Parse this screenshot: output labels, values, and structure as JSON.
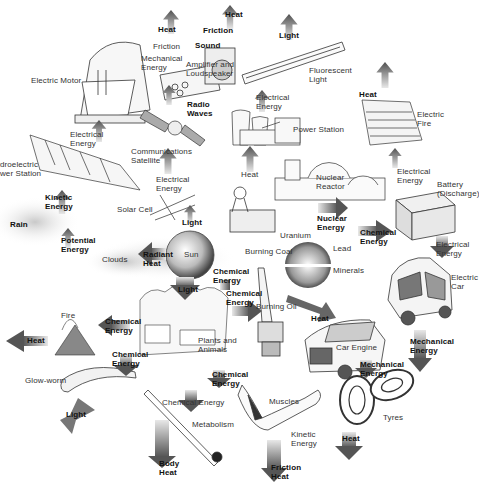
{
  "diagram": {
    "colors": {
      "arrow": "#555555",
      "arrow_fade": "#e6e6e6",
      "line_art": "#333333",
      "background": "#ffffff"
    },
    "objects": [
      {
        "id": "electric-motor",
        "label": "Electric Motor"
      },
      {
        "id": "amplifier",
        "label": "Amplifier and\nLoudspeaker"
      },
      {
        "id": "fluorescent-light",
        "label": "Fluorescent\nLight"
      },
      {
        "id": "power-station",
        "label": "Power Station"
      },
      {
        "id": "electric-fire",
        "label": "Electric\nFire"
      },
      {
        "id": "hydro-station",
        "label": "Hydroelectric\nPower Station"
      },
      {
        "id": "satellite",
        "label": "Communications\nSatellite"
      },
      {
        "id": "nuclear-reactor",
        "label": "Nuclear\nReactor"
      },
      {
        "id": "battery",
        "label": "Battery\n(Discharge)"
      },
      {
        "id": "rain",
        "label": "Rain"
      },
      {
        "id": "solar-cell",
        "label": "Solar Cell"
      },
      {
        "id": "burning-coal",
        "label": "Burning Coal"
      },
      {
        "id": "uranium",
        "label": "Uranium"
      },
      {
        "id": "lead",
        "label": "Lead"
      },
      {
        "id": "minerals",
        "label": "Minerals"
      },
      {
        "id": "clouds",
        "label": "Clouds"
      },
      {
        "id": "sun",
        "label": "Sun"
      },
      {
        "id": "electric-car",
        "label": "Electric\nCar"
      },
      {
        "id": "fire",
        "label": "Fire"
      },
      {
        "id": "plants-animals",
        "label": "Plants and\nAnimals"
      },
      {
        "id": "burning-oil",
        "label": "Burning Oil"
      },
      {
        "id": "car-engine",
        "label": "Car Engine"
      },
      {
        "id": "glow-worm",
        "label": "Glow-worm"
      },
      {
        "id": "metabolism",
        "label": "Metabolism"
      },
      {
        "id": "muscles",
        "label": "Muscles"
      },
      {
        "id": "tyres",
        "label": "Tyres"
      }
    ],
    "arrows": [
      {
        "id": "a-heat-top1",
        "label": "Heat"
      },
      {
        "id": "a-friction1",
        "label": "Friction"
      },
      {
        "id": "a-mech1",
        "label": "Mechanical\nEnergy"
      },
      {
        "id": "a-heat-top2",
        "label": "Heat"
      },
      {
        "id": "a-friction2",
        "label": "Friction"
      },
      {
        "id": "a-sound",
        "label": "Sound"
      },
      {
        "id": "a-light-top",
        "label": "Light"
      },
      {
        "id": "a-radio",
        "label": "Radio\nWaves"
      },
      {
        "id": "a-elec-motor",
        "label": "Electrical\nEnergy"
      },
      {
        "id": "a-elec-light",
        "label": "Electrical\nEnergy"
      },
      {
        "id": "a-heat-fire",
        "label": "Heat"
      },
      {
        "id": "a-heat-ps",
        "label": "Heat"
      },
      {
        "id": "a-elec-sat",
        "label": "Electrical\nEnergy"
      },
      {
        "id": "a-elec-batt",
        "label": "Electrical\nEnergy"
      },
      {
        "id": "a-kinetic-hydro",
        "label": "Kinetic\nEnergy"
      },
      {
        "id": "a-light-solar",
        "label": "Light"
      },
      {
        "id": "a-nuclear",
        "label": "Nuclear\nEnergy"
      },
      {
        "id": "a-chem-batt",
        "label": "Chemical\nEnergy"
      },
      {
        "id": "a-potential",
        "label": "Potential\nEnergy"
      },
      {
        "id": "a-radiant",
        "label": "Radiant\nHeat"
      },
      {
        "id": "a-elec-car",
        "label": "Electrical\nEnergy"
      },
      {
        "id": "a-chem-sun",
        "label": "Chemical\nEnergy"
      },
      {
        "id": "a-light-plants",
        "label": "Light"
      },
      {
        "id": "a-chem-oil",
        "label": "Chemical\nEnergy"
      },
      {
        "id": "a-heat-oil",
        "label": "Heat"
      },
      {
        "id": "a-heat-fire2",
        "label": "Heat"
      },
      {
        "id": "a-chem-fire",
        "label": "Chemical\nEnergy"
      },
      {
        "id": "a-mech-car",
        "label": "Mechanical\nEnergy"
      },
      {
        "id": "a-chem-worm",
        "label": "Chemical\nEnergy"
      },
      {
        "id": "a-mech-engine",
        "label": "Mechanical\nEnergy"
      },
      {
        "id": "a-chem-muscle",
        "label": "Chemical\nEnergy"
      },
      {
        "id": "a-light-worm",
        "label": "Light"
      },
      {
        "id": "a-chem-metab",
        "label": "Chemical Energy"
      },
      {
        "id": "a-kinetic-muscle",
        "label": "Kinetic\nEnergy"
      },
      {
        "id": "a-heat-tyres",
        "label": "Heat"
      },
      {
        "id": "a-body-heat",
        "label": "Body\nHeat"
      },
      {
        "id": "a-friction-heat",
        "label": "Friction\nHeat"
      }
    ]
  }
}
